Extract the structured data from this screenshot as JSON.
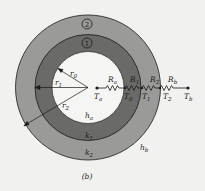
{
  "figure": {
    "caption": "(b)",
    "colors": {
      "background": "#f1f1ef",
      "outer_shell": "#9a9a98",
      "inner_shell": "#6a6a68",
      "cavity": "#f5f5f3",
      "stroke": "#1a1a1a"
    },
    "layers": [
      {
        "marker": "2",
        "conductivity": {
          "base": "k",
          "sub": "2"
        }
      },
      {
        "marker": "1",
        "conductivity": {
          "base": "k",
          "sub": "1"
        }
      }
    ],
    "radii": [
      {
        "base": "r",
        "sub": "0"
      },
      {
        "base": "r",
        "sub": "1"
      },
      {
        "base": "r",
        "sub": "2"
      }
    ],
    "convection": {
      "inner": {
        "base": "h",
        "sub": "a"
      },
      "outer": {
        "base": "h",
        "sub": "b"
      }
    },
    "resistances": [
      {
        "base": "R",
        "sub": "a"
      },
      {
        "base": "R",
        "sub": "1"
      },
      {
        "base": "R",
        "sub": "2"
      },
      {
        "base": "R",
        "sub": "b"
      }
    ],
    "temperatures": [
      {
        "base": "T",
        "sub": "a"
      },
      {
        "base": "T",
        "sub": "0"
      },
      {
        "base": "T",
        "sub": "1"
      },
      {
        "base": "T",
        "sub": "2"
      },
      {
        "base": "T",
        "sub": "b"
      }
    ]
  }
}
